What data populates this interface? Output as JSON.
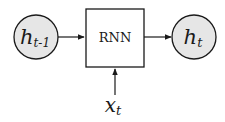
{
  "diagram": {
    "type": "rnn-cell",
    "colors": {
      "node_fill": "#e6e6e6",
      "stroke": "#1a1a1a",
      "background": "#ffffff"
    },
    "nodes": {
      "prev_hidden": {
        "base": "h",
        "sub": "t-1"
      },
      "rnn_cell": {
        "label": "RNN"
      },
      "next_hidden": {
        "base": "h",
        "sub": "t"
      },
      "input": {
        "base": "x",
        "sub": "t"
      }
    },
    "edges": [
      {
        "from": "prev_hidden",
        "to": "rnn_cell"
      },
      {
        "from": "rnn_cell",
        "to": "next_hidden"
      },
      {
        "from": "input",
        "to": "rnn_cell"
      }
    ]
  }
}
